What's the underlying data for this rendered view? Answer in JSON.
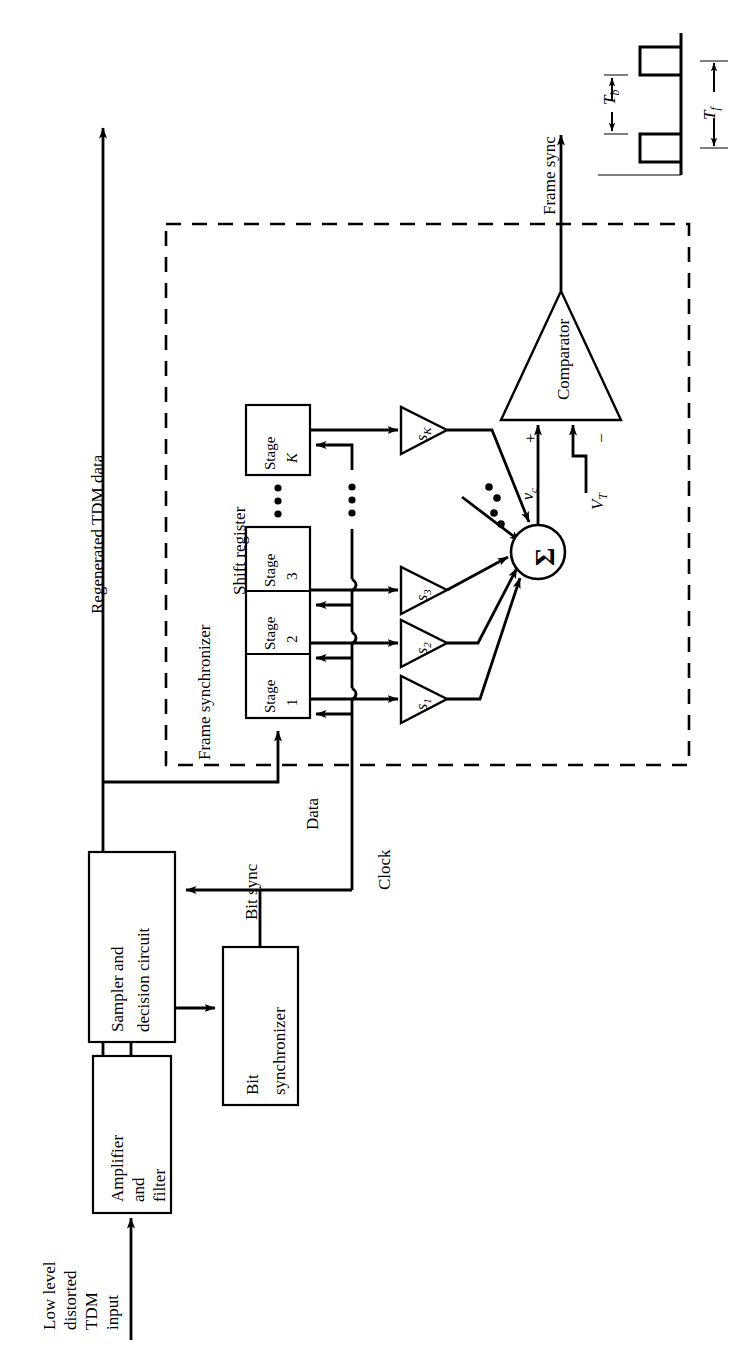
{
  "figure": {
    "type": "block-diagram",
    "orientation": "rotated-90-ccw",
    "title_visible": false
  },
  "labels": {
    "input_line1": "Low level",
    "input_line2": "distorted",
    "input_line3": "TDM",
    "input_line4": "input",
    "regenerated": "Regenerated TDM data",
    "frame_synchronizer": "Frame synchronizer",
    "shift_register": "Shift register",
    "data": "Data",
    "clock": "Clock",
    "bit_sync": "Bit sync",
    "frame_sync": "Frame sync"
  },
  "blocks": [
    {
      "id": "amplifier-filter",
      "lines": [
        "Amplifier",
        "and",
        "filter"
      ]
    },
    {
      "id": "sampler-decision",
      "lines": [
        "Sampler and",
        "decision circuit"
      ]
    },
    {
      "id": "bit-synchronizer",
      "lines": [
        "Bit",
        "synchronizer"
      ]
    }
  ],
  "shift_register": {
    "label": "Shift register",
    "stages": [
      {
        "id": "stage-1",
        "line1": "Stage",
        "line2": "1"
      },
      {
        "id": "stage-2",
        "line1": "Stage",
        "line2": "2"
      },
      {
        "id": "stage-3",
        "line1": "Stage",
        "line2": "3"
      },
      {
        "id": "stage-k",
        "line1": "Stage",
        "line2": "K"
      }
    ],
    "ellipsis": "• • •"
  },
  "amplifiers": [
    {
      "id": "gain-s1",
      "symbol": "s",
      "index": "1"
    },
    {
      "id": "gain-s2",
      "symbol": "s",
      "index": "2"
    },
    {
      "id": "gain-s3",
      "symbol": "s",
      "index": "3"
    },
    {
      "id": "gain-sk",
      "symbol": "s",
      "index": "K"
    }
  ],
  "summer": {
    "symbol": "Σ",
    "output_label": "v",
    "output_sub": "c"
  },
  "comparator": {
    "label": "Comparator",
    "plus": "+",
    "minus": "−",
    "threshold_label": "V",
    "threshold_sub": "T",
    "output_label": "Frame sync"
  },
  "waveform": {
    "tb_label": "T",
    "tb_sub": "b",
    "tf_label": "T",
    "tf_sub": "f"
  },
  "colors": {
    "ink": "#000000",
    "paper": "#ffffff"
  }
}
